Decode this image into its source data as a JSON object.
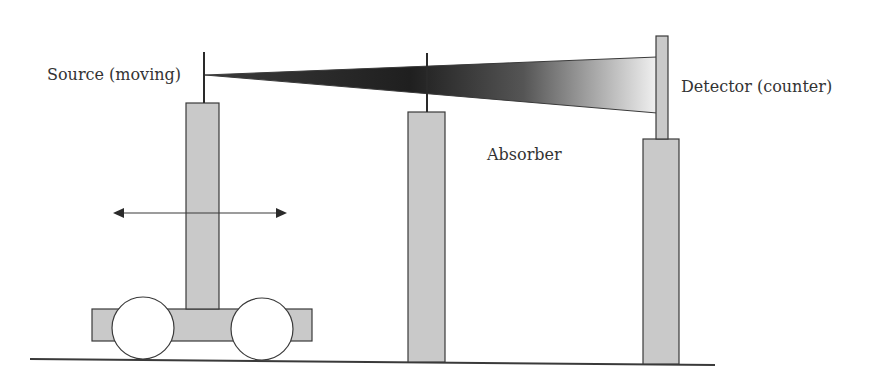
{
  "diagram": {
    "labels": {
      "source": "Source (moving)",
      "detector": "Detector (counter)",
      "absorber": "Absorber"
    },
    "colors": {
      "pillar_fill": "#c9c9c9",
      "outline": "#3a3a3a",
      "beam_dark": "#2a2a2a",
      "beam_light": "#f2f2f2",
      "background": "#ffffff"
    }
  }
}
